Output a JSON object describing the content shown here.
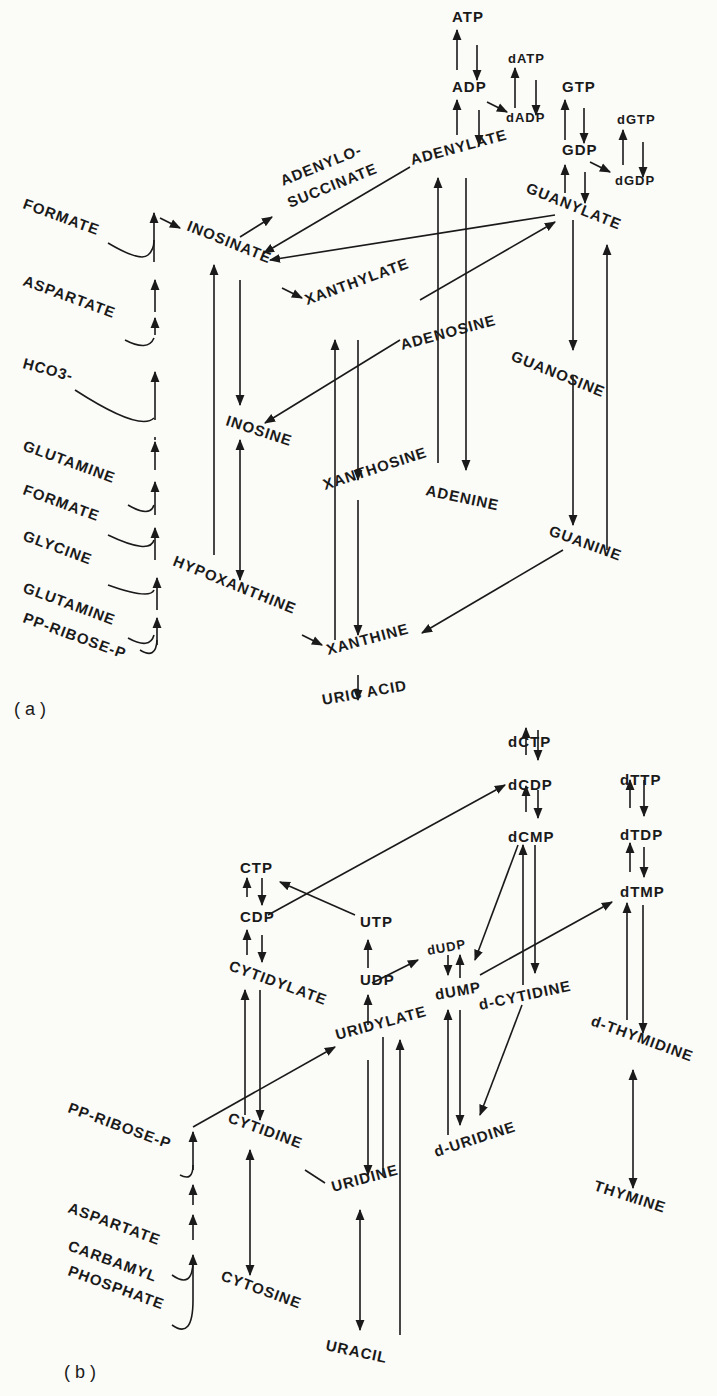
{
  "figure": {
    "panels": [
      {
        "id": "a",
        "label": "( a )"
      },
      {
        "id": "b",
        "label": "( b )"
      }
    ]
  },
  "panel_a": {
    "precursors": [
      "FORMATE",
      "ASPARTATE",
      "HCO3-",
      "GLUTAMINE",
      "FORMATE",
      "GLYCINE",
      "GLUTAMINE",
      "PP-RIBOSE-P"
    ],
    "nodes": {
      "atp": "ATP",
      "adp": "ADP",
      "datp": "dATP",
      "dadp": "dADP",
      "gtp": "GTP",
      "gdp": "GDP",
      "dgtp": "dGTP",
      "dgdp": "dGDP",
      "adenylosuccinate_1": "ADENYLO-",
      "adenylosuccinate_2": "SUCCINATE",
      "adenylate": "ADENYLATE",
      "guanylate": "GUANYLATE",
      "inosinate": "INOSINATE",
      "xanthylate": "XANTHYLATE",
      "adenosine": "ADENOSINE",
      "guanosine": "GUANOSINE",
      "inosine": "INOSINE",
      "xanthosine": "XANTHOSINE",
      "adenine": "ADENINE",
      "guanine": "GUANINE",
      "hypoxanthine": "HYPOXANTHINE",
      "xanthine": "XANTHINE",
      "uric_acid": "URIC ACID"
    }
  },
  "panel_b": {
    "precursors": [
      "PP-RIBOSE-P",
      "ASPARTATE",
      "CARBAMYL",
      "PHOSPHATE"
    ],
    "nodes": {
      "dctp": "dCTP",
      "dcdp": "dCDP",
      "dcmp": "dCMP",
      "dttp": "dTTP",
      "dtdp": "dTDP",
      "dtmp": "dTMP",
      "ctp": "CTP",
      "cdp": "CDP",
      "utp": "UTP",
      "udp": "UDP",
      "dudp": "dUDP",
      "dump": "dUMP",
      "cytidylate": "CYTIDYLATE",
      "uridylate": "URIDYLATE",
      "d_cytidine": "d-CYTIDINE",
      "d_thymidine": "d-THYMIDINE",
      "cytidine": "CYTIDINE",
      "uridine": "URIDINE",
      "d_uridine": "d-URIDINE",
      "cytosine": "CYTOSINE",
      "uracil": "URACIL",
      "thymine": "THYMINE"
    }
  }
}
